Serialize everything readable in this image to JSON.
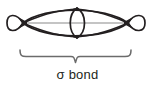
{
  "figure": {
    "background_color": "#ffffff",
    "stroke_color": "#231f20",
    "axis_color": "#808080",
    "brace_color": "#6b6b6b"
  },
  "diagram": {
    "type": "molecular-orbital",
    "nuclei": [
      {
        "name": "left-nucleus",
        "x": 23,
        "y": 23
      },
      {
        "name": "right-nucleus",
        "x": 128,
        "y": 23
      }
    ],
    "back_lobes": [
      {
        "name": "left-back-lobe",
        "x_start": 8,
        "x_end": 23,
        "y_center": 23,
        "height": 13
      },
      {
        "name": "right-back-lobe",
        "x_start": 128,
        "x_end": 146,
        "y_center": 23,
        "height": 13
      }
    ],
    "overlap_region": {
      "name": "sigma-overlap-lens",
      "x_start": 23,
      "x_end": 128,
      "y_top": 7,
      "y_bottom": 39
    },
    "central_lens": {
      "name": "central-vertical-lens",
      "x_start": 68,
      "x_end": 87,
      "y_top": 7,
      "y_bottom": 39
    },
    "bond_axis": {
      "name": "internuclear-axis",
      "x_start": 23,
      "x_end": 128,
      "y": 23
    }
  },
  "annotation": {
    "brace": {
      "label": "span-brace",
      "x_start": 20,
      "x_end": 131,
      "y": 56,
      "tip_y": 63
    },
    "label_text": "σ bond"
  }
}
